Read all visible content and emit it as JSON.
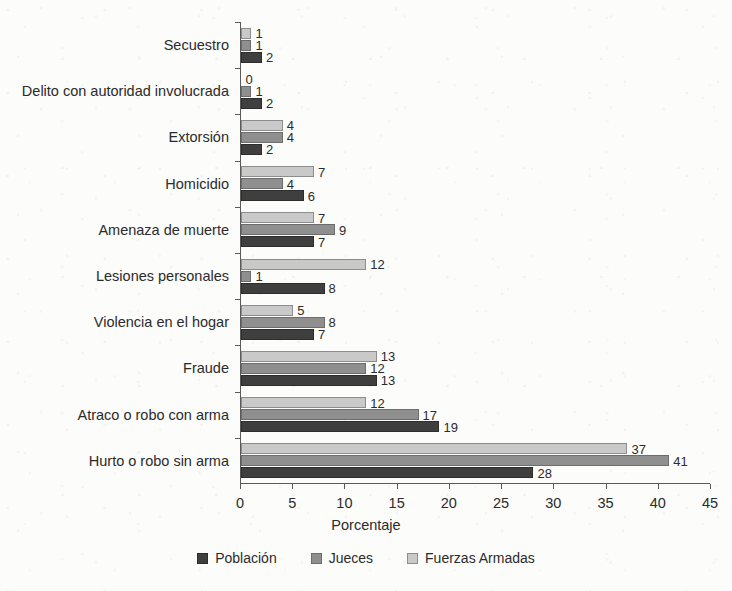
{
  "chart_data": {
    "type": "bar",
    "orientation": "horizontal",
    "title": "",
    "xlabel": "Porcentaje",
    "ylabel": "",
    "xlim": [
      0,
      45
    ],
    "xticks": [
      0,
      5,
      10,
      15,
      20,
      25,
      30,
      35,
      40,
      45
    ],
    "grid": false,
    "legend_position": "bottom",
    "categories": [
      "Secuestro",
      "Delito con autoridad involucrada",
      "Extorsión",
      "Homicidio",
      "Amenaza de muerte",
      "Lesiones personales",
      "Violencia en el hogar",
      "Fraude",
      "Atraco o robo con arma",
      "Hurto o robo sin arma"
    ],
    "series": [
      {
        "name": "Fuerzas Armadas",
        "key": "fuerzas",
        "color": "#c9c9c9",
        "values": [
          1,
          0,
          4,
          7,
          7,
          12,
          5,
          13,
          12,
          37
        ]
      },
      {
        "name": "Jueces",
        "key": "jueces",
        "color": "#8f8f8f",
        "values": [
          1,
          1,
          4,
          4,
          9,
          1,
          8,
          12,
          17,
          41
        ]
      },
      {
        "name": "Población",
        "key": "poblacion",
        "color": "#3f3f3f",
        "values": [
          2,
          2,
          2,
          6,
          7,
          8,
          7,
          13,
          19,
          28
        ]
      }
    ],
    "legend_order": [
      "Población",
      "Jueces",
      "Fuerzas Armadas"
    ]
  }
}
